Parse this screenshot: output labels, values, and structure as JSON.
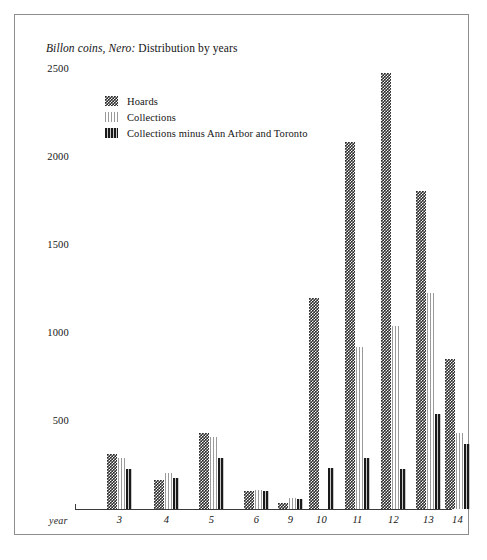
{
  "figure": {
    "title_italic": "Billon coins, Nero:",
    "title_rest": " Distribution by years"
  },
  "legend": {
    "items": [
      {
        "label": "Hoards",
        "swatch": "checkered-swatch"
      },
      {
        "label": "Collections",
        "swatch": "light-striped-swatch"
      },
      {
        "label": "Collections minus Ann Arbor and Toronto",
        "swatch": "dark-striped-swatch"
      }
    ]
  },
  "axes": {
    "x_axis_name": "year",
    "y_ticks": [
      "2500",
      "2000",
      "1500",
      "1000",
      "500"
    ]
  },
  "chart_data": {
    "type": "bar",
    "title": "Billon coins, Nero: Distribution by years",
    "xlabel": "year",
    "ylabel": "",
    "ylim": [
      0,
      2600
    ],
    "grid": false,
    "legend_position": "top-left",
    "categories": [
      "3",
      "4",
      "5",
      "6",
      "9",
      "10",
      "11",
      "12",
      "13",
      "14"
    ],
    "series": [
      {
        "name": "Hoards",
        "values": [
          310,
          165,
          430,
          105,
          35,
          1200,
          2085,
          2480,
          1805,
          850
        ]
      },
      {
        "name": "Collections",
        "values": [
          290,
          205,
          410,
          110,
          60,
          0,
          920,
          1040,
          1225,
          430
        ]
      },
      {
        "name": "Collections minus Ann Arbor and Toronto",
        "values": [
          230,
          175,
          290,
          100,
          55,
          235,
          290,
          230,
          540,
          370
        ]
      }
    ]
  }
}
